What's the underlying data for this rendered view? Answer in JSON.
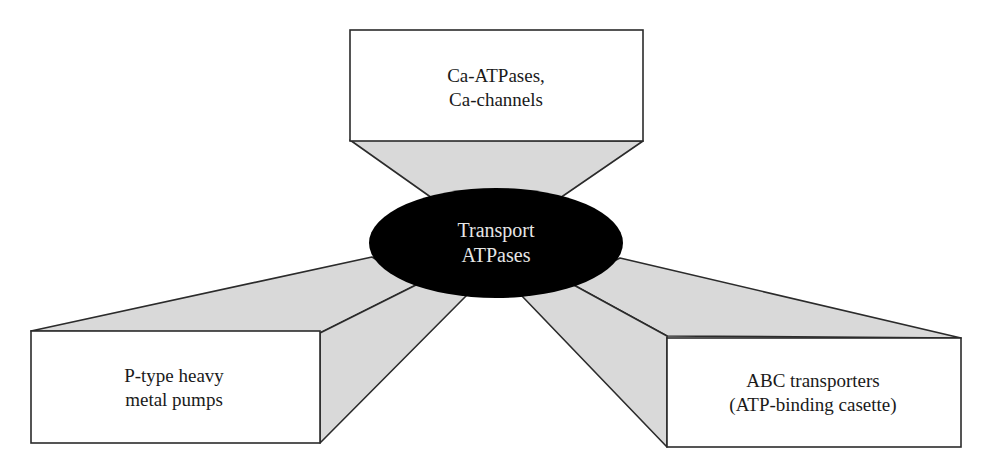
{
  "diagram": {
    "center": {
      "line1": "Transport",
      "line2": "ATPases",
      "fill": "#000000",
      "text_color": "#e6e6e6"
    },
    "nodes": [
      {
        "position": "top",
        "line1": "Ca-ATPases,",
        "line2": "Ca-channels"
      },
      {
        "position": "bottom-left",
        "line1": "P-type heavy",
        "line2": "metal pumps"
      },
      {
        "position": "bottom-right",
        "line1": "ABC transporters",
        "line2": "(ATP-binding casette)"
      }
    ],
    "colors": {
      "connector_fill": "#d9d9d9",
      "box_fill": "#ffffff",
      "stroke": "#2b2b2b"
    }
  }
}
